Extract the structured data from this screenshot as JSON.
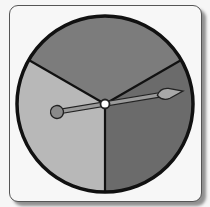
{
  "spinner": {
    "title": "Three-section spinner",
    "center": [
      105,
      104
    ],
    "radius": 88,
    "sections": [
      {
        "name": "top",
        "shade": "medium gray",
        "fill": "#7c7c7c",
        "start_deg": -150,
        "end_deg": -30
      },
      {
        "name": "right",
        "shade": "dark gray",
        "fill": "#6b6b6b",
        "start_deg": -30,
        "end_deg": 90
      },
      {
        "name": "left",
        "shade": "light gray",
        "fill": "#b8b8b8",
        "start_deg": 90,
        "end_deg": 210
      }
    ],
    "pointer": {
      "tail": [
        57,
        112
      ],
      "tip": [
        183,
        91
      ],
      "pointing_to": "right section"
    },
    "colors": {
      "outline": "#111111",
      "card_border": "#555555",
      "card_bg": "#f7f7f7",
      "hub": "#ffffff"
    }
  }
}
